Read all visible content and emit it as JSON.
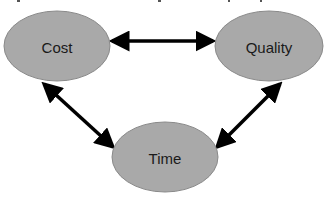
{
  "diagram": {
    "type": "triangle-relationship",
    "colors": {
      "node_fill": "#a9a9a9",
      "node_stroke": "#8a8a8a",
      "arrow": "#000000",
      "background": "#ffffff"
    },
    "nodes": [
      {
        "id": "cost",
        "label": "Cost",
        "cx": 57,
        "cy": 46,
        "rx": 53,
        "ry": 35
      },
      {
        "id": "quality",
        "label": "Quality",
        "cx": 269,
        "cy": 46,
        "rx": 54,
        "ry": 35
      },
      {
        "id": "time",
        "label": "Time",
        "cx": 165,
        "cy": 157,
        "rx": 53,
        "ry": 35
      }
    ],
    "edges": [
      {
        "from": "cost",
        "to": "quality",
        "style": "double-headed-arrow"
      },
      {
        "from": "cost",
        "to": "time",
        "style": "double-headed-arrow"
      },
      {
        "from": "quality",
        "to": "time",
        "style": "double-headed-arrow"
      }
    ]
  }
}
